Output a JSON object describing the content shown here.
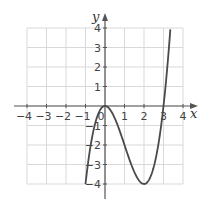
{
  "chart_data": {
    "type": "line",
    "title": "",
    "xlabel": "x",
    "ylabel": "y",
    "xlim": [
      -4,
      4
    ],
    "ylim": [
      -4,
      4
    ],
    "grid": true,
    "x_ticks": [
      "-4",
      "-3",
      "-2",
      "-1",
      "0",
      "1",
      "2",
      "3",
      "4"
    ],
    "y_ticks": [
      "-4",
      "-3",
      "-2",
      "-1",
      "1",
      "2",
      "3",
      "4"
    ],
    "series": [
      {
        "name": "f(x) = x^3 - 3x^2",
        "x": [
          -1,
          -0.5,
          0,
          0.5,
          1,
          1.5,
          2,
          2.5,
          3,
          3.35
        ],
        "y": [
          -4,
          -0.875,
          0,
          -0.625,
          -2,
          -3.375,
          -4,
          -3.125,
          0,
          3.93
        ]
      }
    ],
    "key_points": {
      "local_max": [
        0,
        0
      ],
      "local_min": [
        2,
        -4
      ],
      "x_intercepts": [
        0,
        3
      ]
    }
  },
  "colors": {
    "grid": "#d9d9d9",
    "axis": "#555555",
    "curve": "#4a4a4a"
  }
}
